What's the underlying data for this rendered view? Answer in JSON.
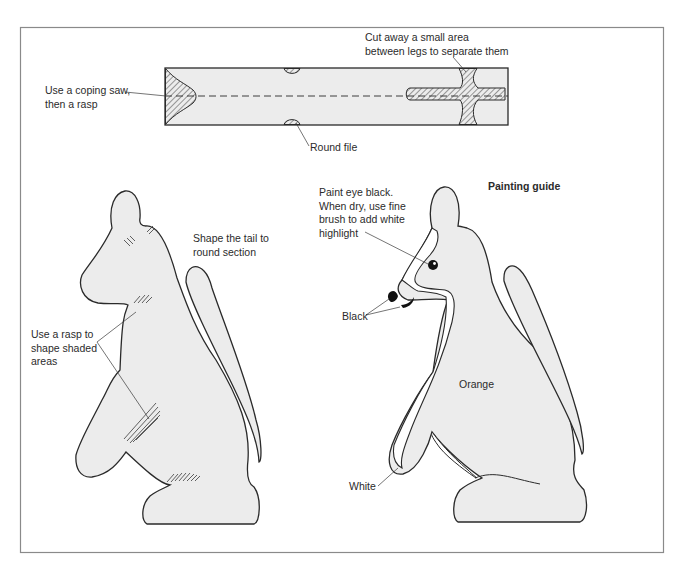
{
  "figure": {
    "frame_color": "#8a8a8a",
    "fill_color": "#ececec",
    "outline_color": "#2a2a2a",
    "hatch_color": "#4a4a4a"
  },
  "top_view": {
    "label_coping_line1": "Use a coping saw,",
    "label_coping_line2": "then a rasp",
    "label_cut_line1": "Cut away a small area",
    "label_cut_line2": "between legs to separate them",
    "label_round_file": "Round file"
  },
  "shaping_view": {
    "label_tail_line1": "Shape the tail to",
    "label_tail_line2": "round section",
    "label_rasp_line1": "Use a rasp to",
    "label_rasp_line2": "shape shaded",
    "label_rasp_line3": "areas"
  },
  "painting_view": {
    "title": "Painting guide",
    "label_eye_line1": "Paint eye black.",
    "label_eye_line2": "When dry, use fine",
    "label_eye_line3": "brush to add white",
    "label_eye_line4": "highlight",
    "label_black": "Black",
    "label_orange": "Orange",
    "label_white": "White"
  }
}
